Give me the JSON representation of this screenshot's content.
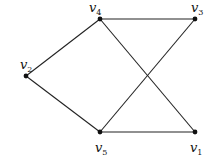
{
  "graph": {
    "nodes": [
      {
        "id": "v1",
        "base": "v",
        "sub": "1",
        "x": 195,
        "y": 132,
        "lx": 190,
        "ly": 152
      },
      {
        "id": "v2",
        "base": "v",
        "sub": "2",
        "x": 26,
        "y": 76,
        "lx": 20,
        "ly": 69
      },
      {
        "id": "v3",
        "base": "v",
        "sub": "3",
        "x": 195,
        "y": 19,
        "lx": 191,
        "ly": 12
      },
      {
        "id": "v4",
        "base": "v",
        "sub": "4",
        "x": 100,
        "y": 19,
        "lx": 89,
        "ly": 12
      },
      {
        "id": "v5",
        "base": "v",
        "sub": "5",
        "x": 100,
        "y": 132,
        "lx": 95,
        "ly": 152
      }
    ],
    "edges": [
      [
        "v4",
        "v3"
      ],
      [
        "v4",
        "v2"
      ],
      [
        "v2",
        "v5"
      ],
      [
        "v5",
        "v1"
      ],
      [
        "v4",
        "v1"
      ],
      [
        "v5",
        "v3"
      ]
    ],
    "colors": {
      "edge": "#222222",
      "node": "#111111"
    }
  }
}
